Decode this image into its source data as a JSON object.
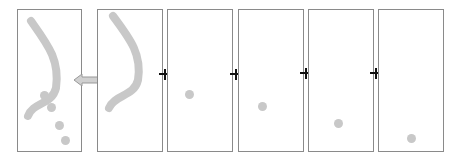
{
  "diagram": {
    "colors": {
      "frame_border": "#8a8a8a",
      "stroke": "#c8c8c8",
      "dot": "#c8c8c8",
      "crosshair": "#111111",
      "arrow_fill": "#d0d0d0"
    },
    "frames": [
      {
        "id": "composite",
        "content": "stroke-and-dots"
      },
      {
        "id": "stroke",
        "content": "stroke"
      },
      {
        "id": "dot-1",
        "content": "dot"
      },
      {
        "id": "dot-2",
        "content": "dot"
      },
      {
        "id": "dot-3",
        "content": "dot"
      },
      {
        "id": "dot-4",
        "content": "dot"
      }
    ],
    "arrow": {
      "direction": "left"
    },
    "crosshair_count": 4
  }
}
